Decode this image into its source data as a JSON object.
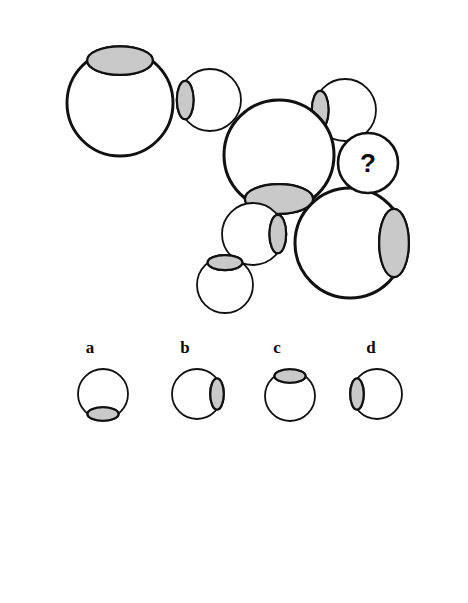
{
  "page": {
    "background_color": "#ffffff",
    "width": 468,
    "height": 603
  },
  "colors": {
    "outline": "#111111",
    "sclera": "#ffffff",
    "iris": "#c9c9c9",
    "pupil": "#0b0b0b",
    "label_text": "#0b0b0b"
  },
  "puzzle": {
    "missing_marker": "?",
    "missing_marker_name": "question-mark",
    "sequence_note": "Chain of eyeballs alternating large and small with rotating iris direction",
    "items": [
      {
        "id": "eye-1",
        "cx": 120,
        "cy": 103,
        "r": 53,
        "iris_direction": "top",
        "size": "large",
        "order": 1
      },
      {
        "id": "eye-2",
        "cx": 210,
        "cy": 100,
        "r": 31,
        "iris_direction": "left",
        "size": "small",
        "order": 2
      },
      {
        "id": "eye-3",
        "cx": 345,
        "cy": 110,
        "r": 31,
        "iris_direction": "left",
        "size": "small",
        "order": 3
      },
      {
        "id": "eye-4",
        "cx": 279,
        "cy": 155,
        "r": 55,
        "iris_direction": "bottom",
        "size": "large",
        "order": 4
      },
      {
        "id": "eye-5",
        "cx": 253,
        "cy": 234,
        "r": 31,
        "iris_direction": "right",
        "size": "small",
        "order": 5
      },
      {
        "id": "eye-6",
        "cx": 225,
        "cy": 285,
        "r": 28,
        "iris_direction": "top",
        "size": "small",
        "order": 6
      },
      {
        "id": "eye-7",
        "cx": 350,
        "cy": 243,
        "r": 55,
        "iris_direction": "right",
        "size": "large",
        "order": 7
      },
      {
        "id": "eye-missing",
        "cx": 368,
        "cy": 163,
        "r": 30,
        "iris_direction": "none",
        "size": "small",
        "order": 8
      }
    ]
  },
  "options": {
    "count": 4,
    "items": [
      {
        "label": "a",
        "label_x": 90,
        "label_y": 353,
        "cx": 103,
        "cy": 394,
        "r": 25,
        "iris_direction": "bottom"
      },
      {
        "label": "b",
        "label_x": 185,
        "label_y": 353,
        "cx": 197,
        "cy": 394,
        "r": 25,
        "iris_direction": "right"
      },
      {
        "label": "c",
        "label_x": 277,
        "label_y": 353,
        "cx": 290,
        "cy": 396,
        "r": 25,
        "iris_direction": "top"
      },
      {
        "label": "d",
        "label_x": 371,
        "label_y": 353,
        "cx": 377,
        "cy": 394,
        "r": 25,
        "iris_direction": "left"
      }
    ]
  }
}
